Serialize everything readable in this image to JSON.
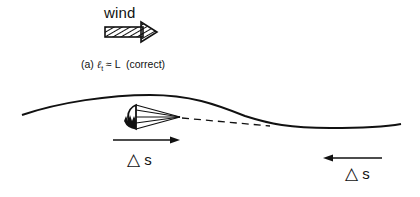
{
  "figure": {
    "wind_label": "wind",
    "caption": {
      "prefix": "(a)",
      "ell_symbol": "ℓ",
      "ell_subscript": "t",
      "relation": "≈ L",
      "note": "(correct)"
    },
    "delta_s_left": {
      "symbol": "△",
      "variable": "s",
      "arrow_direction": "right"
    },
    "delta_s_right": {
      "symbol": "△",
      "variable": "s",
      "arrow_direction": "left"
    },
    "elements": {
      "wind_arrow": "hatched-right-arrow",
      "parachute": "drogue-parachute-icon",
      "trajectory": "solid-curve",
      "extrapolation": "dashed-line"
    },
    "colors": {
      "ink": "#111111",
      "background": "#ffffff"
    }
  }
}
